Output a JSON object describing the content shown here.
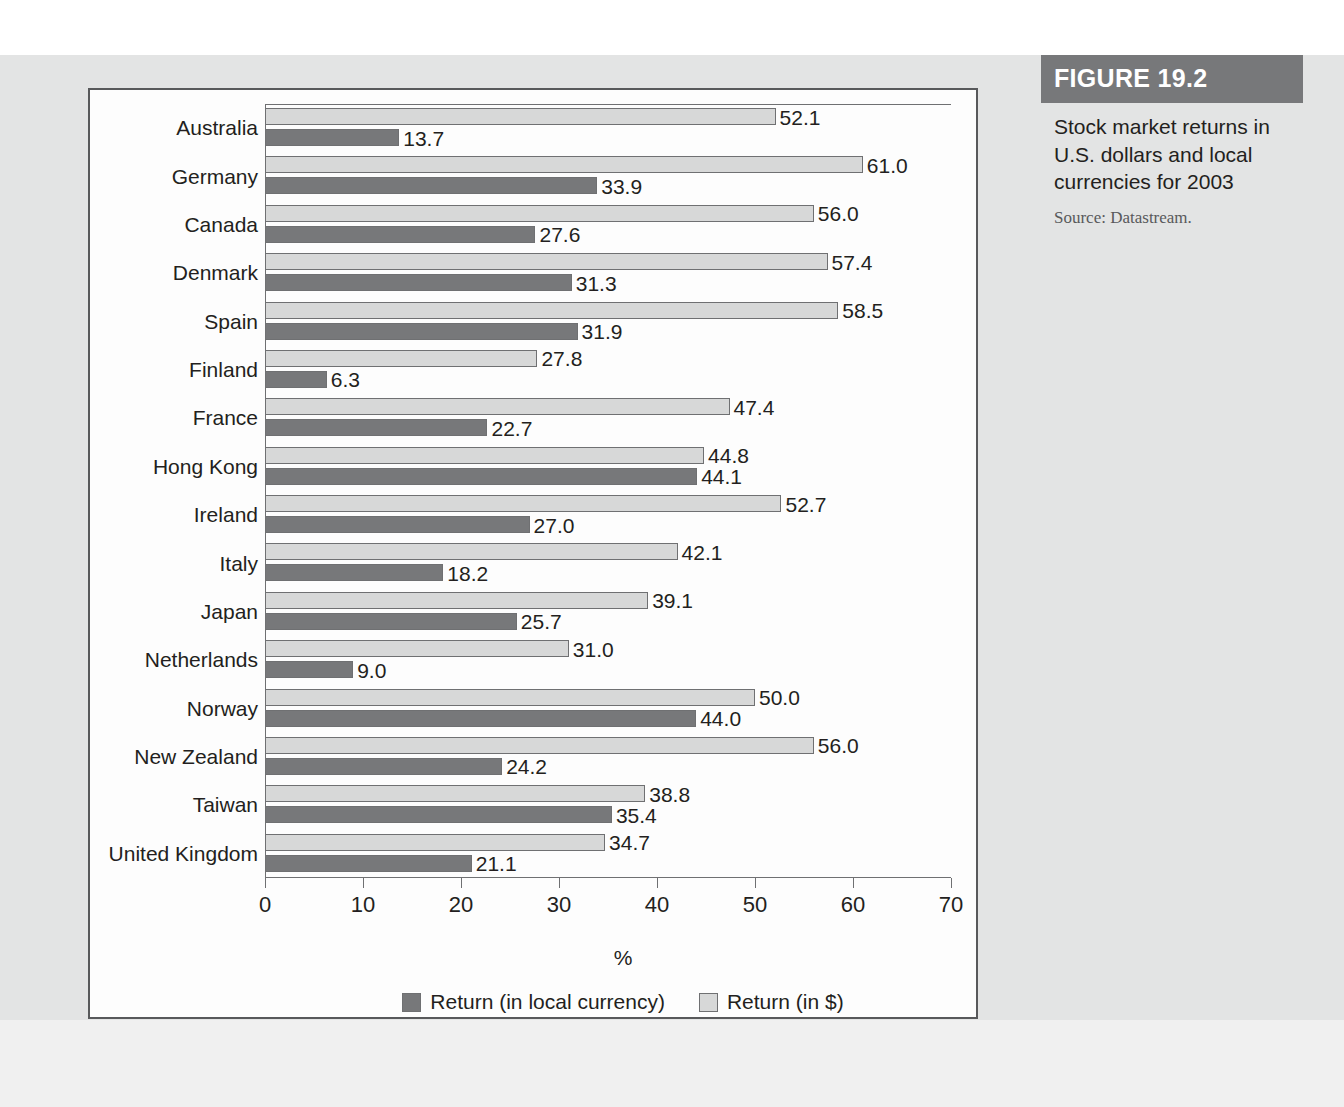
{
  "figure": {
    "header_label": "FIGURE 19.2",
    "caption": "Stock market returns in U.S. dollars and local currencies for 2003",
    "source": "Source: Datastream."
  },
  "chart_data": {
    "type": "bar",
    "orientation": "horizontal",
    "title": "Stock market returns in U.S. dollars and local currencies for 2003",
    "xlabel": "%",
    "ylabel": "",
    "xlim": [
      0,
      70
    ],
    "xticks": [
      0,
      10,
      20,
      30,
      40,
      50,
      60,
      70
    ],
    "grid": false,
    "legend_position": "bottom",
    "categories": [
      "Australia",
      "Germany",
      "Canada",
      "Denmark",
      "Spain",
      "Finland",
      "France",
      "Hong Kong",
      "Ireland",
      "Italy",
      "Japan",
      "Netherlands",
      "Norway",
      "New Zealand",
      "Taiwan",
      "United Kingdom"
    ],
    "series": [
      {
        "name": "Return (in $)",
        "color": "#d7d8d8",
        "values": [
          52.1,
          61.0,
          56.0,
          57.4,
          58.5,
          27.8,
          47.4,
          44.8,
          52.7,
          42.1,
          39.1,
          31.0,
          50.0,
          56.0,
          38.8,
          34.7
        ]
      },
      {
        "name": "Return (in local currency)",
        "color": "#77787a",
        "values": [
          13.7,
          33.9,
          27.6,
          31.3,
          31.9,
          6.3,
          22.7,
          44.1,
          27.0,
          18.2,
          25.7,
          9.0,
          44.0,
          24.2,
          35.4,
          21.1
        ]
      }
    ],
    "value_labels": {
      "usd": [
        "52.1",
        "61.0",
        "56.0",
        "57.4",
        "58.5",
        "27.8",
        "47.4",
        "44.8",
        "52.7",
        "42.1",
        "39.1",
        "31.0",
        "50.0",
        "56.0",
        "38.8",
        "34.7"
      ],
      "local": [
        "13.7",
        "33.9",
        "27.6",
        "31.3",
        "31.9",
        "6.3",
        "22.7",
        "44.1",
        "27.0",
        "18.2",
        "25.7",
        "9.0",
        "44.0",
        "24.2",
        "35.4",
        "21.1"
      ]
    }
  },
  "legend": [
    {
      "label": "Return (in local currency)",
      "color": "#77787a"
    },
    {
      "label": "Return (in $)",
      "color": "#d7d8d8"
    }
  ],
  "colors": {
    "dark_bar": "#77787a",
    "light_bar": "#d7d8d8",
    "frame": "#58595b",
    "page_background": "#e3e4e4",
    "figure_header": "#77787a"
  }
}
